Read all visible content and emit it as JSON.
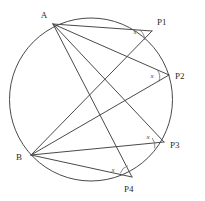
{
  "figure": {
    "kind": "circle-inscribed-angles-diagram",
    "width": 205,
    "height": 201,
    "background_color": "#ffffff",
    "stroke_color": "#4a4a4a",
    "label_color": "#2b2b2b",
    "angle_label_color": "#4a4a4a"
  },
  "circle": {
    "name": "circumscribed-circle",
    "center_x": 91,
    "center_y": 99.5,
    "radius": 81.5
  },
  "endpoints": [
    {
      "id": "A",
      "label": "A",
      "x": 53,
      "y": 24,
      "label_x": 44,
      "label_y": 18
    },
    {
      "id": "B",
      "label": "B",
      "x": 31,
      "y": 155,
      "label_x": 19,
      "label_y": 160
    }
  ],
  "inscribed_points": [
    {
      "id": "P1",
      "label": "P1",
      "x": 152,
      "y": 31,
      "label_x": 157,
      "label_y": 25,
      "angle_label": "x",
      "angle_label_x": 135,
      "angle_label_y": 34
    },
    {
      "id": "P2",
      "label": "P2",
      "x": 169,
      "y": 75,
      "label_x": 175,
      "label_y": 79,
      "angle_label": "x",
      "angle_label_x": 152,
      "angle_label_y": 76
    },
    {
      "id": "P3",
      "label": "P3",
      "x": 164,
      "y": 142,
      "label_x": 170,
      "label_y": 148,
      "angle_label": "x",
      "angle_label_x": 148,
      "angle_label_y": 139
    },
    {
      "id": "P4",
      "label": "P4",
      "x": 132,
      "y": 177,
      "label_x": 128,
      "label_y": 192,
      "angle_label": "x",
      "angle_label_x": 113,
      "angle_label_y": 172
    }
  ],
  "chords": [
    {
      "name": "chord-A-P1",
      "from": "A",
      "to": "P1"
    },
    {
      "name": "chord-A-P2",
      "from": "A",
      "to": "P2"
    },
    {
      "name": "chord-A-P3",
      "from": "A",
      "to": "P3"
    },
    {
      "name": "chord-A-P4",
      "from": "A",
      "to": "P4"
    },
    {
      "name": "chord-B-P1",
      "from": "B",
      "to": "P1"
    },
    {
      "name": "chord-B-P2",
      "from": "B",
      "to": "P2"
    },
    {
      "name": "chord-B-P3",
      "from": "B",
      "to": "P3"
    },
    {
      "name": "chord-B-P4",
      "from": "B",
      "to": "P4"
    }
  ],
  "angle_markers": [
    {
      "name": "angle-marker-P1",
      "at": "P1",
      "label": "x"
    },
    {
      "name": "angle-marker-P2",
      "at": "P2",
      "label": "x"
    },
    {
      "name": "angle-marker-P3",
      "at": "P3",
      "label": "x"
    },
    {
      "name": "angle-marker-P4",
      "at": "P4",
      "label": "x"
    }
  ]
}
